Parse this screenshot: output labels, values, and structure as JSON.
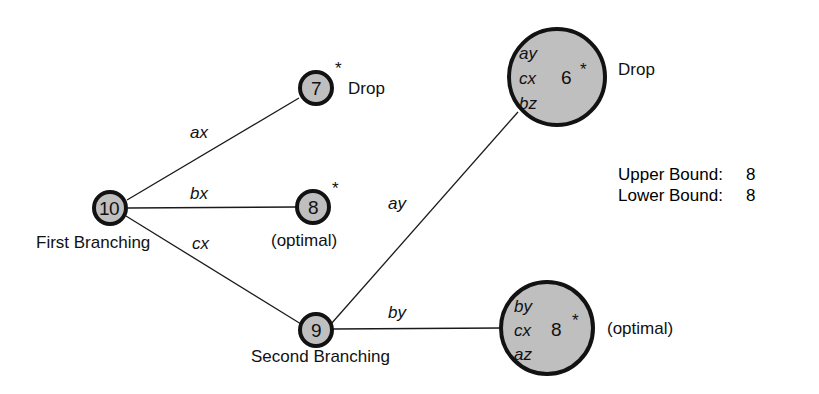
{
  "figure": {
    "background": "#ffffff",
    "node_fill": "#bfbfbf",
    "node_stroke": "#121212",
    "edge_stroke": "#1a1a1a"
  },
  "nodes": {
    "root": {
      "value": "10",
      "caption": "First Branching"
    },
    "drop_small": {
      "value": "7",
      "star": "*",
      "annotation": "Drop"
    },
    "optimal_small": {
      "value": "8",
      "star": "*",
      "annotation": "(optimal)"
    },
    "second": {
      "value": "9",
      "caption": "Second Branching"
    },
    "drop_big": {
      "set": [
        "ay",
        "cx",
        "bz"
      ],
      "value": "6",
      "star": "*",
      "annotation": "Drop"
    },
    "optimal_big": {
      "set": [
        "by",
        "cx",
        "az"
      ],
      "value": "8",
      "star": "*",
      "annotation": "(optimal)"
    }
  },
  "edges": [
    {
      "id": "root-to-drop-small",
      "label": "ax"
    },
    {
      "id": "root-to-optimal-small",
      "label": "bx"
    },
    {
      "id": "root-to-second",
      "label": "cx"
    },
    {
      "id": "second-to-drop-big",
      "label": "ay"
    },
    {
      "id": "second-to-optimal-big",
      "label": "by"
    }
  ],
  "bounds": {
    "upper_label": "Upper Bound:",
    "upper_value": "8",
    "lower_label": "Lower Bound:",
    "lower_value": "8"
  }
}
